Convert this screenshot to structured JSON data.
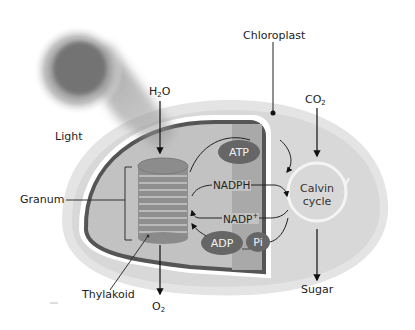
{
  "labels": {
    "chloroplast": "Chloroplast",
    "light": "Light",
    "granum": "Granum",
    "thylakoid": "Thylakoid",
    "h2o_main": "H",
    "h2o_sub": "2",
    "h2o_tail": "O",
    "o2_main": "O",
    "o2_sub": "2",
    "co2_main": "CO",
    "co2_sub": "2",
    "sugar": "Sugar",
    "calvin_line1": "Calvin",
    "calvin_line2": "cycle"
  },
  "molecules": {
    "atp": "ATP",
    "adp": "ADP",
    "pi": "Pi",
    "nadph": "NADPH",
    "nadp_main": "NADP",
    "nadp_sup": "+"
  },
  "colors": {
    "stroma_outer": "#e6e6e6",
    "stroma_inner": "#d9d9d9",
    "membrane": "#555555",
    "thylakoid_space": "#b8b8b8",
    "oval_fill": "#6a6a6a",
    "granum_disc": "#9a9a9a",
    "light_glow": "#777777"
  }
}
